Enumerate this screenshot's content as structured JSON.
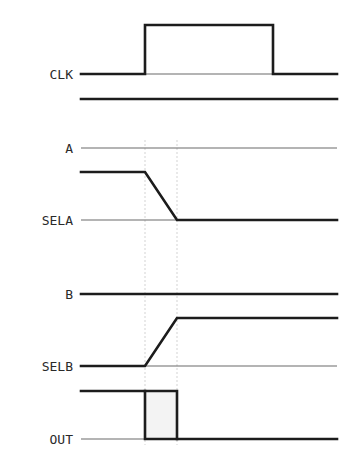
{
  "diagram": {
    "type": "timing-diagram",
    "signals": [
      {
        "name": "CLK",
        "label": "CLK",
        "description": "clock pulse high between t1 and t3"
      },
      {
        "name": "A",
        "label": "A",
        "description": "input A, constant"
      },
      {
        "name": "SELA",
        "label": "SELA",
        "description": "falls from high to low between t1 and t2"
      },
      {
        "name": "B",
        "label": "B",
        "description": "input B, constant"
      },
      {
        "name": "SELB",
        "label": "SELB",
        "description": "rises from low to high between t1 and t2"
      },
      {
        "name": "OUT",
        "label": "OUT",
        "description": "glitch pulse between t1 and t2"
      }
    ],
    "labels": {
      "clk": "CLK",
      "a": "A",
      "sela": "SELA",
      "b": "B",
      "selb": "SELB",
      "out": "OUT"
    },
    "colors": {
      "background": "#ffffff",
      "trace": "#1c1c1c",
      "baseline": "#6a6a6a",
      "guide": "#c8c8c8"
    }
  }
}
